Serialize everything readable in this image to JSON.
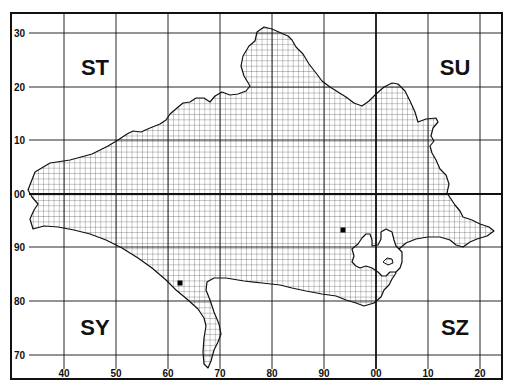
{
  "map": {
    "frame": {
      "x": 11,
      "y": 13,
      "width": 491,
      "height": 366
    },
    "colors": {
      "ink": "#111111",
      "background": "#ffffff",
      "fine_grid": "#333333"
    },
    "x_ticks": [
      {
        "label": "40",
        "x": 64
      },
      {
        "label": "50",
        "x": 116
      },
      {
        "label": "60",
        "x": 168
      },
      {
        "label": "70",
        "x": 220
      },
      {
        "label": "80",
        "x": 272
      },
      {
        "label": "90",
        "x": 324
      },
      {
        "label": "00",
        "x": 376
      },
      {
        "label": "10",
        "x": 428
      },
      {
        "label": "20",
        "x": 480
      }
    ],
    "y_ticks": [
      {
        "label": "30",
        "y": 33
      },
      {
        "label": "20",
        "y": 87
      },
      {
        "label": "10",
        "y": 140
      },
      {
        "label": "00",
        "y": 194
      },
      {
        "label": "90",
        "y": 247
      },
      {
        "label": "80",
        "y": 301
      },
      {
        "label": "70",
        "y": 355
      }
    ],
    "major_lines": {
      "vertical_x": 376,
      "horizontal_y": 194
    },
    "grid_squares": [
      {
        "label": "ST",
        "x": 95,
        "y": 75
      },
      {
        "label": "SU",
        "x": 455,
        "y": 75
      },
      {
        "label": "SY",
        "x": 95,
        "y": 335
      },
      {
        "label": "SZ",
        "x": 455,
        "y": 335
      }
    ],
    "records": [
      {
        "name": "record-1",
        "x": 180,
        "y": 283
      },
      {
        "name": "record-2",
        "x": 343,
        "y": 230
      }
    ],
    "county_outline": "28,190 35,172 50,163 70,160 92,154 108,146 118,140 127,134 133,131 141,132 150,128 160,124 166,120 170,114 177,108 183,103 190,102 196,98 204,98 210,102 215,96 222,92 230,95 238,94 246,91 250,86 244,76 241,66 243,56 249,46 255,41 257,32 264,27 272,29 281,33 288,36 292,40 296,47 303,54 309,64 316,73 322,81 330,87 338,92 346,97 354,103 362,106 369,101 376,94 384,87 392,83 398,84 405,91 410,101 415,112 418,122 426,119 436,118 438,122 433,128 431,136 434,141 430,146 432,153 436,160 440,169 446,175 449,184 447,193 451,199 455,205 460,211 463,217 472,220 480,224 489,227 494,231 487,236 477,239 470,242 463,247 456,245 450,240 440,237 428,237 416,239 406,243 399,249 393,256 388,262 392,268 396,273 392,279 389,285 384,290 381,297 374,303 364,306 356,303 346,300 336,296 322,294 306,291 292,288 280,285 262,283 244,281 226,278 214,278 207,282 206,290 210,300 214,312 219,324 221,334 218,342 214,350 211,361 208,368 204,364 203,352 204,338 206,326 204,318 198,309 188,300 176,290 166,280 152,268 138,258 122,248 106,240 90,234 74,230 58,227 44,226 33,229 30,219 34,210 38,204 32,197",
    "harbour_outline": "352,249 358,244 362,238 366,234 370,234 372,240 372,246 378,245 381,239 381,232 386,229 392,232 394,240 396,246 402,252 402,262 400,268 396,272 390,272 386,276 382,276 378,272 372,268 366,266 360,268 356,266 352,262 354,256",
    "harbour_island": "383,262 387,258 392,259 393,263 388,265"
  }
}
